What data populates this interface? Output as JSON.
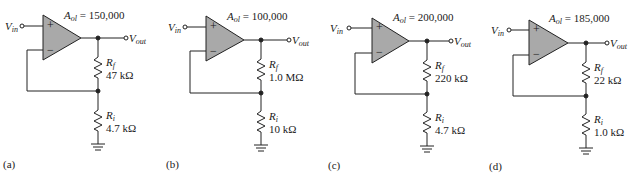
{
  "figure": {
    "panels": [
      {
        "id": "a",
        "label": "(a)",
        "aol_symbol": "A",
        "aol_sub": "ol",
        "aol_value": "= 150,000",
        "vin": "V",
        "vin_sub": "in",
        "vout": "V",
        "vout_sub": "out",
        "rf_symbol": "R",
        "rf_sub": "f",
        "rf_value": "47 kΩ",
        "ri_symbol": "R",
        "ri_sub": "i",
        "ri_value": "4.7 kΩ",
        "plus": "+",
        "minus": "−"
      },
      {
        "id": "b",
        "label": "(b)",
        "aol_symbol": "A",
        "aol_sub": "ol",
        "aol_value": "= 100,000",
        "vin": "V",
        "vin_sub": "in",
        "vout": "V",
        "vout_sub": "out",
        "rf_symbol": "R",
        "rf_sub": "f",
        "rf_value": "1.0 MΩ",
        "ri_symbol": "R",
        "ri_sub": "i",
        "ri_value": "10 kΩ",
        "plus": "+",
        "minus": "−"
      },
      {
        "id": "c",
        "label": "(c)",
        "aol_symbol": "A",
        "aol_sub": "ol",
        "aol_value": "= 200,000",
        "vin": "V",
        "vin_sub": "in",
        "vout": "V",
        "vout_sub": "out",
        "rf_symbol": "R",
        "rf_sub": "f",
        "rf_value": "220 kΩ",
        "ri_symbol": "R",
        "ri_sub": "i",
        "ri_value": "4.7 kΩ",
        "plus": "+",
        "minus": "−"
      },
      {
        "id": "d",
        "label": "(d)",
        "aol_symbol": "A",
        "aol_sub": "ol",
        "aol_value": "= 185,000",
        "vin": "V",
        "vin_sub": "in",
        "vout": "V",
        "vout_sub": "out",
        "rf_symbol": "R",
        "rf_sub": "f",
        "rf_value": "22 kΩ",
        "ri_symbol": "R",
        "ri_sub": "i",
        "ri_value": "1.0 kΩ",
        "plus": "+",
        "minus": "−"
      }
    ],
    "colors": {
      "opamp_fill": "#a9a9a9",
      "wire": "#222222",
      "background": "#ffffff"
    }
  }
}
